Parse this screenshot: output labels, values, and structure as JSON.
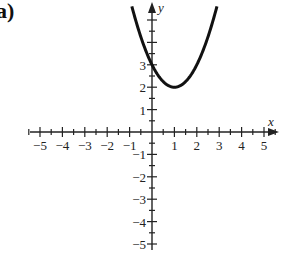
{
  "panel_label": "a)",
  "chart_data": {
    "type": "line",
    "title": "",
    "xlabel": "x",
    "ylabel": "y",
    "xlim": [
      -5,
      5
    ],
    "ylim": [
      -5,
      5
    ],
    "grid": false,
    "legend": null,
    "x_tick_labels": [
      "-5",
      "-4",
      "-3",
      "-2",
      "-1",
      "1",
      "2",
      "3",
      "4",
      "5"
    ],
    "y_tick_labels": [
      "3",
      "2",
      "1",
      "-1",
      "-2",
      "-3",
      "-4",
      "-5"
    ],
    "minor_ticks": 0.5,
    "series": [
      {
        "name": "parabola",
        "function": "y = (x - 1)^2 + 2",
        "vertex": [
          1,
          2
        ],
        "y_intercept": 3,
        "x": [
          -0.9,
          -0.5,
          0,
          0.5,
          1,
          1.5,
          2,
          2.5,
          2.9
        ],
        "y": [
          5.61,
          4.25,
          3,
          2.25,
          2,
          2.25,
          3,
          4.25,
          5.61
        ],
        "color": "#111111"
      }
    ]
  },
  "colors": {
    "curve": "#111111",
    "axes": "#222222",
    "background": "#ffffff"
  }
}
